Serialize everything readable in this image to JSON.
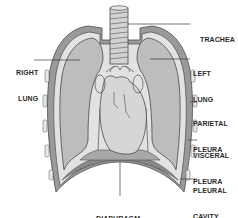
{
  "diagram": {
    "type": "anatomical-illustration",
    "colors": {
      "background": "#ffffff",
      "lung_fill": "#bdbdbd",
      "pleura_band": "#e2e2e2",
      "wall_fill": "#9a9a9a",
      "heart_fill": "#d6d6d6",
      "outline": "#4a4a4a",
      "label_text": "#2a2a2a"
    },
    "labels": {
      "trachea": {
        "line1": "TRACHEA"
      },
      "right_lung": {
        "line1": "RIGHT",
        "line2": "LUNG"
      },
      "left_lung": {
        "line1": "LEFT",
        "line2": "LUNG"
      },
      "parietal_pleura": {
        "line1": "PARIETAL",
        "line2": "PLEURA"
      },
      "visceral_pleura": {
        "line1": "VISCERAL",
        "line2": "PLEURA"
      },
      "pleural_cavity": {
        "line1": "PLEURAL",
        "line2": "CAVITY"
      },
      "diaphragm": {
        "line1": "DIAPHRAGM"
      }
    }
  }
}
